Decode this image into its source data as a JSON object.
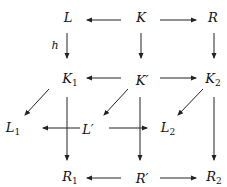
{
  "diagram": {
    "type": "commutative-diagram",
    "nodes": [
      {
        "id": "L",
        "base": "L",
        "sub": "",
        "prime": false,
        "x": 68,
        "y": 17
      },
      {
        "id": "K",
        "base": "K",
        "sub": "",
        "prime": false,
        "x": 141,
        "y": 17
      },
      {
        "id": "R",
        "base": "R",
        "sub": "",
        "prime": false,
        "x": 213,
        "y": 17
      },
      {
        "id": "K1",
        "base": "K",
        "sub": "1",
        "prime": false,
        "x": 70,
        "y": 80
      },
      {
        "id": "Kp",
        "base": "K",
        "sub": "",
        "prime": true,
        "x": 142,
        "y": 80
      },
      {
        "id": "K2",
        "base": "K",
        "sub": "2",
        "prime": false,
        "x": 213,
        "y": 80
      },
      {
        "id": "L1",
        "base": "L",
        "sub": "1",
        "prime": false,
        "x": 13,
        "y": 129
      },
      {
        "id": "Lp",
        "base": "L",
        "sub": "",
        "prime": true,
        "x": 88,
        "y": 129
      },
      {
        "id": "L2",
        "base": "L",
        "sub": "2",
        "prime": false,
        "x": 168,
        "y": 129
      },
      {
        "id": "R1",
        "base": "R",
        "sub": "1",
        "prime": false,
        "x": 70,
        "y": 178
      },
      {
        "id": "Rp",
        "base": "R",
        "sub": "",
        "prime": true,
        "x": 142,
        "y": 178
      },
      {
        "id": "R2",
        "base": "R",
        "sub": "2",
        "prime": false,
        "x": 214,
        "y": 178
      }
    ],
    "edges": [
      {
        "from": "K",
        "to": "L",
        "label": "",
        "x1": 121,
        "y1": 20,
        "x2": 87,
        "y2": 20
      },
      {
        "from": "K",
        "to": "R",
        "label": "",
        "x1": 160,
        "y1": 20,
        "x2": 196,
        "y2": 20
      },
      {
        "from": "L",
        "to": "K1",
        "label": "h",
        "x1": 67,
        "y1": 33,
        "x2": 67,
        "y2": 58
      },
      {
        "from": "K",
        "to": "Kp",
        "label": "",
        "x1": 141,
        "y1": 33,
        "x2": 141,
        "y2": 58
      },
      {
        "from": "R",
        "to": "K2",
        "label": "",
        "x1": 214,
        "y1": 33,
        "x2": 214,
        "y2": 58
      },
      {
        "from": "Kp",
        "to": "K1",
        "label": "",
        "x1": 121,
        "y1": 78,
        "x2": 87,
        "y2": 78
      },
      {
        "from": "Kp",
        "to": "K2",
        "label": "",
        "x1": 160,
        "y1": 78,
        "x2": 196,
        "y2": 78
      },
      {
        "from": "K1",
        "to": "L1",
        "label": "",
        "x1": 49,
        "y1": 89,
        "x2": 25,
        "y2": 115
      },
      {
        "from": "Kp",
        "to": "Lp",
        "label": "",
        "x1": 128,
        "y1": 89,
        "x2": 104,
        "y2": 115
      },
      {
        "from": "K2",
        "to": "L2",
        "label": "",
        "x1": 203,
        "y1": 89,
        "x2": 178,
        "y2": 115
      },
      {
        "from": "Lp",
        "to": "L1",
        "label": "",
        "x1": 80,
        "y1": 128,
        "x2": 43,
        "y2": 128
      },
      {
        "from": "Lp",
        "to": "L2",
        "label": "",
        "x1": 109,
        "y1": 128,
        "x2": 147,
        "y2": 128
      },
      {
        "from": "K1",
        "to": "R1",
        "label": "",
        "x1": 67,
        "y1": 97,
        "x2": 67,
        "y2": 160
      },
      {
        "from": "Kp",
        "to": "Rp",
        "label": "",
        "x1": 140,
        "y1": 97,
        "x2": 140,
        "y2": 160
      },
      {
        "from": "K2",
        "to": "R2",
        "label": "",
        "x1": 214,
        "y1": 97,
        "x2": 214,
        "y2": 160
      },
      {
        "from": "Rp",
        "to": "R1",
        "label": "",
        "x1": 121,
        "y1": 178,
        "x2": 87,
        "y2": 178
      },
      {
        "from": "Rp",
        "to": "R2",
        "label": "",
        "x1": 160,
        "y1": 178,
        "x2": 196,
        "y2": 178
      }
    ],
    "edge_labels": [
      {
        "text": "h",
        "x": 55,
        "y": 45
      }
    ],
    "colors": {
      "stroke": "#222222",
      "text": "#111111",
      "background": "#ffffff"
    }
  }
}
